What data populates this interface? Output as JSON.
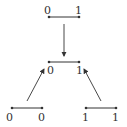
{
  "diagram": {
    "nodes": [
      {
        "id": "top",
        "x1": 49,
        "x2": 79,
        "y": 17,
        "labels": [
          "0",
          "1"
        ],
        "label_pos": "above"
      },
      {
        "id": "middle",
        "x1": 49,
        "x2": 79,
        "y": 62,
        "labels": [
          "0",
          "1"
        ],
        "label_pos": "below"
      },
      {
        "id": "bottom-left",
        "x1": 12,
        "x2": 42,
        "y": 108,
        "labels": [
          "0",
          "0"
        ],
        "label_pos": "below"
      },
      {
        "id": "bottom-right",
        "x1": 86,
        "x2": 116,
        "y": 108,
        "labels": [
          "1",
          "1"
        ],
        "label_pos": "below"
      }
    ],
    "edges": [
      {
        "from": "top",
        "to": "middle"
      },
      {
        "from": "bottom-left",
        "to": "middle"
      },
      {
        "from": "bottom-right",
        "to": "middle"
      }
    ],
    "colors": {
      "line": "#333333",
      "text": "#333333",
      "background": "#ffffff"
    }
  }
}
